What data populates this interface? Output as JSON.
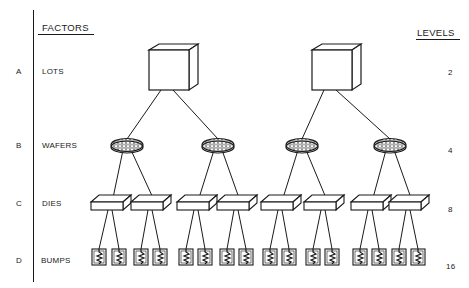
{
  "headers": {
    "factors": "FACTORS",
    "levels": "LEVELS"
  },
  "rows": [
    {
      "letter": "A",
      "factor": "LOTS",
      "level": "2",
      "icon": "cube-icon"
    },
    {
      "letter": "B",
      "factor": "WAFERS",
      "level": "4",
      "icon": "wafer-icon"
    },
    {
      "letter": "C",
      "factor": "DIES",
      "level": "8",
      "icon": "die-icon"
    },
    {
      "letter": "D",
      "factor": "BUMPS",
      "level": "16",
      "icon": "bump-icon"
    }
  ],
  "tree": {
    "lots": [
      167,
      330
    ],
    "wafers": [
      127,
      218,
      302,
      390
    ],
    "dies": [
      110,
      150,
      196,
      236,
      280,
      323,
      370,
      408
    ],
    "bumps": [
      99,
      119,
      141,
      160,
      186,
      205,
      227,
      246,
      270,
      289,
      313,
      332,
      360,
      379,
      399,
      418
    ]
  },
  "colors": {
    "ink": "#1a1a1a",
    "background": "#ffffff"
  }
}
